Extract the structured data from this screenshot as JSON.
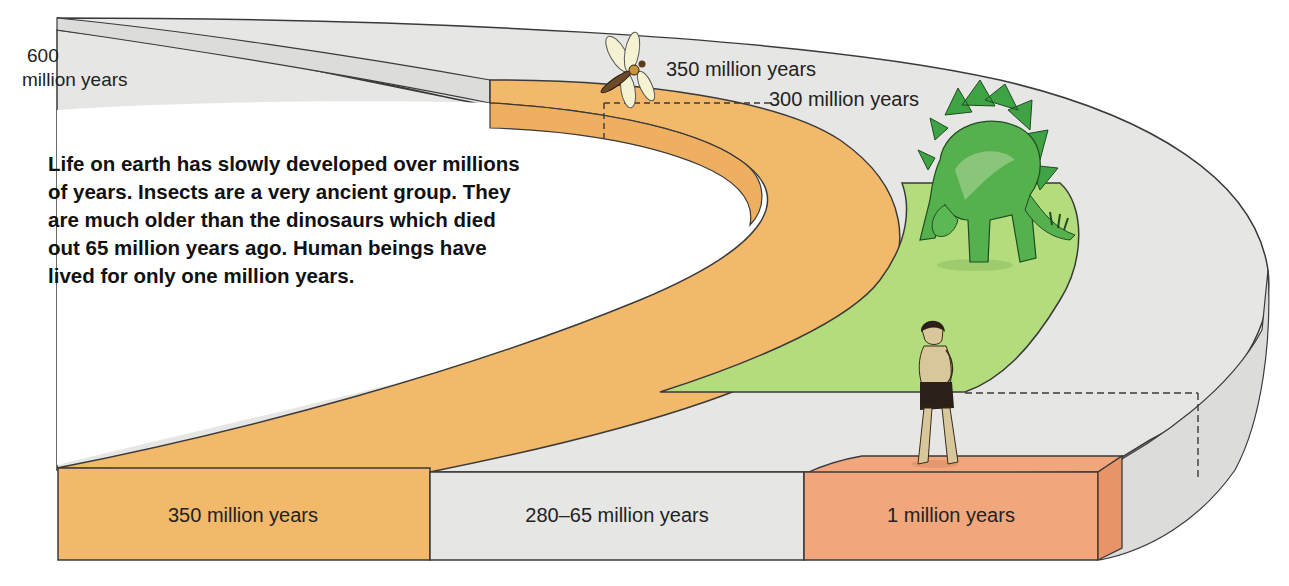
{
  "diagram": {
    "colors": {
      "outline": "#3a3a3a",
      "band_grey": "#e6e6e4",
      "band_grey_side": "#dcdcda",
      "insect_band": "#f2b96a",
      "insect_band_side": "#eeb060",
      "dinosaur_band": "#b3dc7c",
      "human_block": "#f2a67c",
      "human_block_side": "#e99468",
      "text": "#1a1a1a"
    },
    "top_labels": {
      "start_number": "600",
      "start_unit": "million years",
      "insects": "350 million years",
      "insects_end": "300 million years"
    },
    "caption": {
      "lines": [
        "Life on earth has slowly developed over millions",
        "of years. Insects are a very ancient group. They",
        "are much older than the dinosaurs which died",
        "out 65 million years ago. Human beings have",
        "lived for only one million years."
      ]
    },
    "blocks": [
      {
        "label": "350 million years",
        "color": "#f2b96a",
        "represents": "insects"
      },
      {
        "label": "280–65 million years",
        "color": "#e6e6e4",
        "represents": "dinosaurs"
      },
      {
        "label": "1 million years",
        "color": "#f2a67c",
        "represents": "humans"
      }
    ],
    "figures": [
      {
        "name": "dragonfly",
        "position": "insect band start"
      },
      {
        "name": "stegosaurus",
        "position": "dinosaur band"
      },
      {
        "name": "early human",
        "position": "human block"
      }
    ]
  }
}
